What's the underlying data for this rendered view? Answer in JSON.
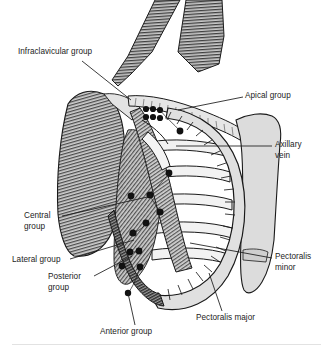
{
  "figure": {
    "background_color": "#ffffff",
    "text_color": "#232323",
    "line_color": "#1a1a1a",
    "width": 333,
    "height": 354
  },
  "labels": [
    {
      "id": "infraclavicular-group",
      "text": "Infraclavicular group",
      "x": 18,
      "y": 47,
      "leader": {
        "x1": 82,
        "y1": 61,
        "x2": 131,
        "y2": 100
      }
    },
    {
      "id": "apical-group",
      "text": "Apical group",
      "x": 245,
      "y": 91,
      "leader": {
        "x1": 243,
        "y1": 97,
        "x2": 178,
        "y2": 110
      }
    },
    {
      "id": "axillary-vein",
      "text": "Axillary\nvein",
      "x": 275,
      "y": 140,
      "leader": {
        "x1": 272,
        "y1": 146,
        "x2": 176,
        "y2": 146
      }
    },
    {
      "id": "pectoralis-minor",
      "text": "Pectoralis\nminor",
      "x": 275,
      "y": 252,
      "leader": {
        "x1": 272,
        "y1": 258,
        "x2": 190,
        "y2": 243
      }
    },
    {
      "id": "pectoralis-major",
      "text": "Pectoralis major",
      "x": 196,
      "y": 313,
      "leader": {
        "x1": 222,
        "y1": 311,
        "x2": 209,
        "y2": 273
      }
    },
    {
      "id": "central-group",
      "text": "Central\ngroup",
      "x": 24,
      "y": 211,
      "leader": {
        "x1": 62,
        "y1": 216,
        "x2": 152,
        "y2": 196
      }
    },
    {
      "id": "lateral-group",
      "text": "Lateral group",
      "x": 12,
      "y": 255,
      "leader": {
        "x1": 70,
        "y1": 259,
        "x2": 134,
        "y2": 240
      }
    },
    {
      "id": "posterior-group",
      "text": "Posterior\ngroup",
      "x": 48,
      "y": 272,
      "leader": {
        "x1": 94,
        "y1": 276,
        "x2": 132,
        "y2": 256
      }
    },
    {
      "id": "anterior-group",
      "text": "Anterior group",
      "x": 100,
      "y": 327,
      "leader": {
        "x1": 135,
        "y1": 325,
        "x2": 128,
        "y2": 293
      }
    }
  ],
  "anatomy": {
    "structures": [
      "deltoid muscle",
      "clavicle",
      "sternocleidomastoid",
      "pectoralis major",
      "pectoralis minor",
      "axillary vein",
      "ribs",
      "sternum",
      "serratus anterior",
      "latissimus dorsi"
    ],
    "lymph_node_groups": [
      "apical",
      "infraclavicular",
      "central",
      "lateral",
      "posterior",
      "anterior"
    ]
  },
  "divider": {
    "visible": true
  }
}
